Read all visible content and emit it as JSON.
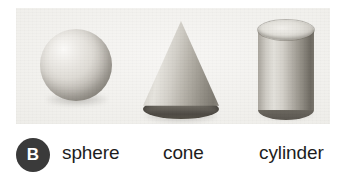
{
  "figure": {
    "badge_label": "B",
    "background_color": "#efeeea",
    "page_background": "#ffffff",
    "badge_color": "#3a3a3a",
    "badge_text_color": "#ffffff",
    "label_color": "#1d1d1d",
    "shapes": [
      {
        "id": "sphere",
        "label": "sphere",
        "icon": "sphere-shape-icon"
      },
      {
        "id": "cone",
        "label": "cone",
        "icon": "cone-shape-icon"
      },
      {
        "id": "cylinder",
        "label": "cylinder",
        "icon": "cylinder-shape-icon"
      }
    ]
  }
}
